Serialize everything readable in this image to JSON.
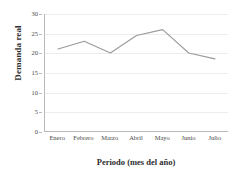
{
  "chart_data": {
    "type": "line",
    "title": "",
    "subtitle": "",
    "xlabel": "Periodo (mes del año)",
    "ylabel": "Demanda real",
    "categories": [
      "Enero",
      "Febrero",
      "Marzo",
      "Abril",
      "Mayo",
      "Junio",
      "Julio"
    ],
    "values": [
      21,
      23,
      20,
      24.5,
      26,
      20,
      18.5
    ],
    "series": [
      {
        "name": "Demanda real",
        "values": [
          21,
          23,
          20,
          24.5,
          26,
          20,
          18.5
        ]
      }
    ],
    "ylim": [
      0,
      30
    ],
    "yticks": [
      0,
      5,
      10,
      15,
      20,
      25,
      30
    ],
    "ytick_labels": [
      "0",
      "5",
      "10",
      "15",
      "20",
      "25",
      "30"
    ],
    "xlim_categories": 7,
    "grid": true,
    "grid_axis": "y",
    "legend": false,
    "legend_position": "none",
    "line_color": "#9a9a9a",
    "axis_color": "#b9b9b9",
    "grid_color": "#ededed",
    "background": "#ffffff",
    "markers": false
  }
}
